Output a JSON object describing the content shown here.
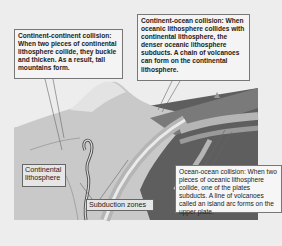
{
  "diagram": {
    "callouts": {
      "continent_continent": "Continent-continent collision: When two pieces of continental lithosphere collide, they buckle and thicken. As a result, tall mountains form.",
      "continent_ocean": "Continent-ocean collision: When oceanic lithosphere collides with continental lithosphere, the denser oceanic lithosphere subducts. A chain of volcanoes can form on the continental lithosphere.",
      "ocean_ocean": "Ocean-ocean collision: When two pieces of oceanic lithosphere collide, one of the plates subducts. A line of volcanoes called an island arc forms on the upper plate."
    },
    "labels": {
      "continental_lithosphere": "Continental lithosphere",
      "subduction_zones": "Subduction zones"
    },
    "colors": {
      "background": "#ededed",
      "continental_crust": "#c9c9c9",
      "oceanic_plate": "#7a7a7a",
      "mantle": "#5e5e5e",
      "slab_band": "#b5b5b5"
    }
  }
}
